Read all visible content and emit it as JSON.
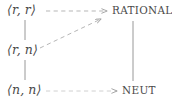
{
  "diagram": {
    "type": "lattice-hasse-diagram",
    "background_color": "#ffffff",
    "ink_color": "#4a4a4a",
    "nodes": [
      {
        "id": "rr",
        "label": "⟨r, r⟩",
        "style": "math",
        "column": "left",
        "row": "top"
      },
      {
        "id": "rn",
        "label": "⟨r, n⟩",
        "style": "math",
        "column": "left",
        "row": "middle"
      },
      {
        "id": "nn",
        "label": "⟨n, n⟩",
        "style": "math",
        "column": "left",
        "row": "bottom"
      },
      {
        "id": "rational",
        "label": "RATIONAL",
        "style": "smallcaps",
        "column": "right",
        "row": "top"
      },
      {
        "id": "neut",
        "label": "NEUT",
        "style": "smallcaps",
        "column": "right",
        "row": "bottom"
      }
    ],
    "edges": [
      {
        "id": "rr-rn",
        "from": "rr",
        "to": "rn",
        "line": "solid",
        "arrow": false
      },
      {
        "id": "rn-nn",
        "from": "rn",
        "to": "nn",
        "line": "solid",
        "arrow": false
      },
      {
        "id": "rational-neut",
        "from": "rational",
        "to": "neut",
        "line": "solid",
        "arrow": false
      },
      {
        "id": "rr-rational",
        "from": "rr",
        "to": "rational",
        "line": "dashed",
        "arrow": true
      },
      {
        "id": "rn-rational",
        "from": "rn",
        "to": "rational",
        "line": "dashed",
        "arrow": true
      },
      {
        "id": "nn-neut",
        "from": "nn",
        "to": "neut",
        "line": "dashed",
        "arrow": true
      }
    ]
  }
}
